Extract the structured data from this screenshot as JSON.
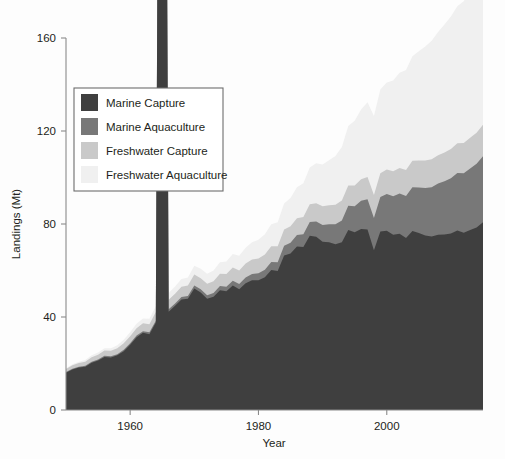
{
  "chart_data": {
    "type": "area",
    "stacked": true,
    "title": "",
    "xlabel": "Year",
    "ylabel": "Landings (Mt)",
    "xlim": [
      1950,
      2015
    ],
    "ylim": [
      0,
      172
    ],
    "xticks": [
      1960,
      1980,
      2000
    ],
    "yticks": [
      0,
      40,
      80,
      120,
      160
    ],
    "grid": false,
    "legend_position": "upper-left-inside",
    "x": [
      1950,
      1951,
      1952,
      1953,
      1954,
      1955,
      1956,
      1957,
      1958,
      1959,
      1960,
      1961,
      1962,
      1963,
      1964,
      1965,
      1966,
      1967,
      1968,
      1969,
      1970,
      1971,
      1972,
      1973,
      1974,
      1975,
      1976,
      1977,
      1978,
      1979,
      1980,
      1981,
      1982,
      1983,
      1984,
      1985,
      1986,
      1987,
      1988,
      1989,
      1990,
      1991,
      1992,
      1993,
      1994,
      1995,
      1996,
      1997,
      1998,
      1999,
      2000,
      2001,
      2002,
      2003,
      2004,
      2005,
      2006,
      2007,
      2008,
      2009,
      2010,
      2011,
      2012,
      2013,
      2014,
      2015
    ],
    "series": [
      {
        "name": "Marine Capture",
        "color": "#3f3f3f",
        "values": [
          16.0,
          17.4,
          18.3,
          18.6,
          20.3,
          21.3,
          22.8,
          22.6,
          23.5,
          25.3,
          28.1,
          31.3,
          33.2,
          32.6,
          37.6,
          638.9,
          42.3,
          44.8,
          47.5,
          47.8,
          52.3,
          50.5,
          47.9,
          48.7,
          51.5,
          51.1,
          53.5,
          51.9,
          54.5,
          55.8,
          55.8,
          57.1,
          60.2,
          59.8,
          66.4,
          67.3,
          70.3,
          70.1,
          74.9,
          74.5,
          72.4,
          72.1,
          71.3,
          72.1,
          77.4,
          76.4,
          77.9,
          77.6,
          68.7,
          76.8,
          77.1,
          75.4,
          75.8,
          74.0,
          77.0,
          76.1,
          75.1,
          74.6,
          75.4,
          75.5,
          75.9,
          77.2,
          76.2,
          77.4,
          78.5,
          80.8
        ]
      },
      {
        "name": "Marine Aquaculture",
        "color": "#787878",
        "values": [
          0.3,
          0.3,
          0.3,
          0.4,
          0.4,
          0.4,
          0.5,
          0.5,
          0.5,
          0.6,
          0.6,
          0.7,
          0.7,
          0.8,
          0.8,
          0.9,
          1.0,
          1.0,
          1.1,
          1.2,
          1.3,
          1.4,
          1.5,
          1.6,
          1.8,
          1.9,
          2.1,
          2.3,
          2.5,
          2.7,
          3.0,
          3.2,
          3.5,
          3.8,
          4.2,
          4.6,
          5.0,
          5.5,
          6.0,
          6.6,
          7.2,
          7.8,
          8.6,
          9.4,
          10.4,
          11.2,
          12.1,
          13.0,
          13.9,
          14.8,
          15.8,
          16.5,
          17.3,
          18.0,
          18.8,
          19.6,
          20.4,
          21.2,
          22.0,
          22.9,
          23.8,
          24.7,
          25.6,
          26.5,
          27.4,
          28.3
        ]
      },
      {
        "name": "Freshwater Capture",
        "color": "#c9c9c9",
        "values": [
          1.3,
          1.5,
          1.6,
          1.8,
          2.0,
          2.1,
          2.3,
          2.4,
          2.6,
          2.8,
          3.0,
          3.2,
          3.4,
          3.5,
          3.7,
          3.9,
          4.1,
          4.2,
          4.4,
          4.5,
          4.7,
          4.8,
          4.9,
          5.1,
          5.3,
          5.5,
          5.7,
          5.8,
          6.0,
          6.2,
          6.4,
          6.6,
          6.7,
          6.8,
          7.0,
          7.1,
          7.2,
          7.4,
          7.6,
          7.8,
          8.0,
          8.2,
          8.4,
          8.6,
          8.8,
          9.0,
          9.3,
          9.6,
          9.9,
          10.2,
          10.5,
          10.8,
          11.0,
          11.2,
          11.4,
          11.6,
          11.8,
          12.0,
          12.2,
          12.4,
          12.6,
          12.8,
          13.0,
          13.2,
          13.4,
          13.6
        ]
      },
      {
        "name": "Freshwater Aquaculture",
        "color": "#f0f0f0",
        "values": [
          0.4,
          0.5,
          0.6,
          0.7,
          0.8,
          0.9,
          1.0,
          1.1,
          1.3,
          1.5,
          1.7,
          1.9,
          2.1,
          2.3,
          2.5,
          2.7,
          2.9,
          3.1,
          3.3,
          3.5,
          3.7,
          4.0,
          4.3,
          4.6,
          5.0,
          5.4,
          5.8,
          6.3,
          6.8,
          7.4,
          8.0,
          8.7,
          9.5,
          10.3,
          11.2,
          12.2,
          13.3,
          14.5,
          15.8,
          17.2,
          18.0,
          19.3,
          21.0,
          23.0,
          25.5,
          27.8,
          30.0,
          32.2,
          34.0,
          36.0,
          37.5,
          39.0,
          41.0,
          43.0,
          45.0,
          47.0,
          49.0,
          51.0,
          53.0,
          55.0,
          57.0,
          59.0,
          61.0,
          63.0,
          65.5,
          68.0
        ]
      }
    ]
  },
  "legend": {
    "entries": [
      {
        "label": "Marine Capture",
        "color": "#3f3f3f"
      },
      {
        "label": "Marine Aquaculture",
        "color": "#787878"
      },
      {
        "label": "Freshwater Capture",
        "color": "#c9c9c9"
      },
      {
        "label": "Freshwater Aquaculture",
        "color": "#f0f0f0"
      }
    ]
  },
  "axes": {
    "y_label": "Landings (Mt)",
    "x_label": "Year",
    "y_tick_labels": [
      "0",
      "40",
      "80",
      "120",
      "160"
    ],
    "x_tick_labels": [
      "1960",
      "1980",
      "2000"
    ]
  }
}
